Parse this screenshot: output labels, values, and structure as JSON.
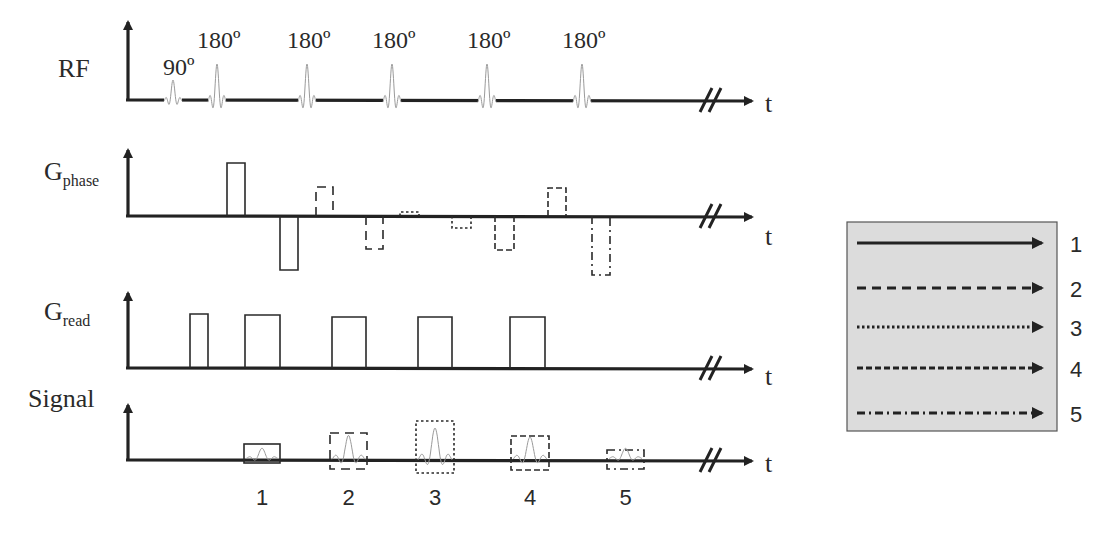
{
  "diagram": {
    "time_label": "t",
    "rows": [
      {
        "id": "rf",
        "label": "RF",
        "sub": ""
      },
      {
        "id": "gphase",
        "label": "G",
        "sub": "phase"
      },
      {
        "id": "gread",
        "label": "G",
        "sub": "read"
      },
      {
        "id": "signal",
        "label": "Signal",
        "sub": ""
      }
    ],
    "rf_pulses": [
      {
        "label": "90º",
        "x": 173,
        "height": 20
      },
      {
        "label": "180º",
        "x": 217,
        "height": 36
      },
      {
        "label": "180º",
        "x": 307,
        "height": 36
      },
      {
        "label": "180º",
        "x": 392,
        "height": 36
      },
      {
        "label": "180º",
        "x": 487,
        "height": 36
      },
      {
        "label": "180º",
        "x": 582,
        "height": 36
      }
    ],
    "gphase_lobes": [
      {
        "x1": 227,
        "x2": 245,
        "top": 163,
        "bottom": 216,
        "style": 1
      },
      {
        "x1": 280,
        "x2": 298,
        "top": 216,
        "bottom": 270,
        "style": 1
      },
      {
        "x1": 316,
        "x2": 333,
        "top": 187,
        "bottom": 216,
        "style": 2
      },
      {
        "x1": 366,
        "x2": 383,
        "top": 216,
        "bottom": 249,
        "style": 2
      },
      {
        "x1": 400,
        "x2": 419,
        "top": 212,
        "bottom": 216,
        "style": 3
      },
      {
        "x1": 452,
        "x2": 471,
        "top": 216,
        "bottom": 228,
        "style": 3
      },
      {
        "x1": 495,
        "x2": 514,
        "top": 216,
        "bottom": 250,
        "style": 4
      },
      {
        "x1": 548,
        "x2": 566,
        "top": 188,
        "bottom": 216,
        "style": 4
      },
      {
        "x1": 592,
        "x2": 610,
        "top": 216,
        "bottom": 275,
        "style": 5
      }
    ],
    "gread_lobes": [
      {
        "x1": 190,
        "x2": 208,
        "top": 314
      },
      {
        "x1": 245,
        "x2": 280,
        "top": 315
      },
      {
        "x1": 332,
        "x2": 366,
        "top": 317
      },
      {
        "x1": 418,
        "x2": 452,
        "top": 317
      },
      {
        "x1": 510,
        "x2": 545,
        "top": 317
      }
    ],
    "echoes": [
      {
        "label": "1",
        "x1": 244,
        "x2": 280,
        "top": 444,
        "bottom": 463,
        "style": 1
      },
      {
        "label": "2",
        "x1": 330,
        "x2": 367,
        "top": 433,
        "bottom": 469,
        "style": 2
      },
      {
        "label": "3",
        "x1": 416,
        "x2": 454,
        "top": 421,
        "bottom": 473,
        "style": 3
      },
      {
        "label": "4",
        "x1": 511,
        "x2": 549,
        "top": 436,
        "bottom": 470,
        "style": 4
      },
      {
        "label": "5",
        "x1": 607,
        "x2": 644,
        "top": 450,
        "bottom": 469,
        "style": 5
      }
    ]
  },
  "legend": {
    "background": "#dcdcdc",
    "border": "#555555",
    "items": [
      {
        "label": "1",
        "style": "solid"
      },
      {
        "label": "2",
        "style": "long-dash"
      },
      {
        "label": "3",
        "style": "dotted"
      },
      {
        "label": "4",
        "style": "short-dash"
      },
      {
        "label": "5",
        "style": "dash-dot"
      }
    ]
  },
  "styles": {
    "1": "",
    "2": "9 6",
    "3": "2.5 2.5",
    "4": "6 3",
    "5": "8 4 2 4"
  }
}
